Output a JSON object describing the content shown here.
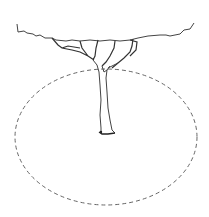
{
  "figure": {
    "colors": {
      "background": "#ffffff",
      "line": "#3a3a3a",
      "dash": "#666666"
    },
    "ellipse": {
      "cx": 106,
      "cy": 137,
      "rx": 91,
      "ry": 68
    }
  }
}
